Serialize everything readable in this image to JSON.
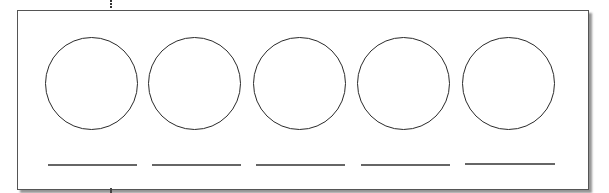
{
  "worksheet": {
    "description": "Five empty circles with blank answer lines beneath",
    "colors": {
      "stroke": "#2a2a2a",
      "line": "#666666",
      "frame_border": "#555555",
      "shadow": "#5a5a5a"
    },
    "circles": [
      {
        "index": 1,
        "label": ""
      },
      {
        "index": 2,
        "label": ""
      },
      {
        "index": 3,
        "label": ""
      },
      {
        "index": 4,
        "label": ""
      },
      {
        "index": 5,
        "label": ""
      }
    ],
    "answer_lines": [
      {
        "index": 1,
        "value": ""
      },
      {
        "index": 2,
        "value": ""
      },
      {
        "index": 3,
        "value": ""
      },
      {
        "index": 4,
        "value": ""
      },
      {
        "index": 5,
        "value": ""
      }
    ]
  }
}
